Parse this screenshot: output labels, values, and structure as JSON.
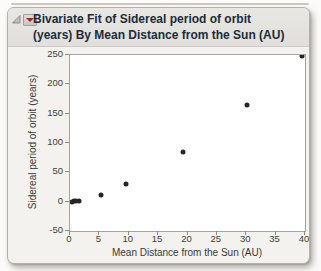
{
  "window": {
    "title_lines": [
      "Bivariate Fit of Sidereal period of orbit",
      "(years) By Mean Distance from the Sun (AU)"
    ],
    "icons": {
      "disclosure": "disclosure-triangle-open",
      "menu": "red-triangle-menu"
    }
  },
  "colors": {
    "title_text": "#212c3a",
    "titlebar_bg": "#e4e3e0",
    "window_bg": "#f3f2ef",
    "plot_bg": "#ffffff",
    "plot_border": "#a6a4a0",
    "axis_text": "#404040",
    "point": "#262626",
    "red_triangle": "#9e2b20"
  },
  "chart_data": {
    "type": "scatter",
    "title": "Bivariate Fit of Sidereal period of orbit (years) By Mean Distance from the Sun (AU)",
    "xlabel": "Mean Distance from the Sun (AU)",
    "ylabel": "Sidereal period of orbit (years)",
    "xlim": [
      0,
      40
    ],
    "ylim": [
      -50,
      250
    ],
    "xticks": [
      0,
      5,
      10,
      15,
      20,
      25,
      30,
      35,
      40
    ],
    "yticks": [
      -50,
      0,
      50,
      100,
      150,
      200,
      250
    ],
    "grid": false,
    "legend": false,
    "points": [
      {
        "x": 0.39,
        "y": 0.2
      },
      {
        "x": 0.72,
        "y": 0.6
      },
      {
        "x": 1.0,
        "y": 1.0
      },
      {
        "x": 1.52,
        "y": 1.9
      },
      {
        "x": 5.2,
        "y": 11.9
      },
      {
        "x": 9.54,
        "y": 29.5
      },
      {
        "x": 19.19,
        "y": 84.0
      },
      {
        "x": 30.06,
        "y": 164.8
      },
      {
        "x": 39.53,
        "y": 248.5
      }
    ]
  }
}
